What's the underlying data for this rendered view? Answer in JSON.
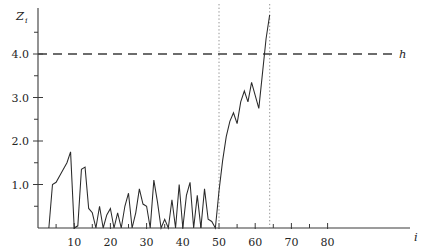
{
  "chart_data": {
    "type": "line",
    "title": "",
    "xlabel": "i",
    "ylabel": "Z_i",
    "xlim": [
      0,
      85
    ],
    "ylim": [
      0,
      4.9
    ],
    "grid": false,
    "legend_position": "inline-right",
    "x_ticks_major": [
      10,
      20,
      30,
      40,
      50,
      60,
      70,
      80
    ],
    "x_ticks_minor": [
      5,
      15,
      25,
      35,
      45,
      55,
      65,
      75
    ],
    "x_tick_labels": [
      "10",
      "20",
      "30",
      "40",
      "50",
      "60",
      "70",
      "80"
    ],
    "y_ticks_major": [
      1.0,
      2.0,
      3.0,
      4.0
    ],
    "y_ticks_minor": [
      0.5,
      1.5,
      2.5,
      3.5,
      4.5
    ],
    "y_tick_labels": [
      "1.0",
      "2.0",
      "3.0",
      "4.0"
    ],
    "annotations": [
      {
        "name": "threshold",
        "label": "h",
        "type": "hline",
        "y": 4.0,
        "style": "dashed"
      },
      {
        "name": "marker-50",
        "label": "",
        "type": "vline",
        "x": 50,
        "style": "dotted"
      },
      {
        "name": "marker-64",
        "label": "",
        "type": "vline",
        "x": 64,
        "style": "dotted"
      }
    ],
    "series": [
      {
        "name": "Z_i",
        "style": "solid",
        "x": [
          3,
          4,
          5,
          6,
          7,
          8,
          9,
          10,
          11,
          12,
          13,
          14,
          15,
          16,
          17,
          18,
          19,
          20,
          21,
          22,
          23,
          24,
          25,
          26,
          27,
          28,
          29,
          30,
          31,
          32,
          33,
          34,
          35,
          36,
          37,
          38,
          39,
          40,
          41,
          42,
          43,
          44,
          45,
          46,
          47,
          48,
          49,
          50,
          51,
          52,
          53,
          54,
          55,
          56,
          57,
          58,
          59,
          60,
          61,
          62,
          63,
          64
        ],
        "values": [
          0.0,
          1.0,
          1.05,
          1.2,
          1.35,
          1.5,
          1.75,
          0.0,
          0.05,
          1.35,
          1.4,
          0.45,
          0.35,
          0.0,
          0.5,
          0.0,
          0.3,
          0.45,
          0.0,
          0.35,
          0.0,
          0.5,
          0.8,
          0.0,
          0.35,
          0.9,
          0.55,
          0.5,
          0.0,
          1.1,
          0.6,
          0.0,
          0.2,
          0.0,
          0.65,
          0.0,
          1.0,
          0.0,
          0.75,
          1.05,
          0.0,
          0.75,
          0.0,
          0.9,
          0.2,
          0.15,
          0.0,
          0.85,
          1.55,
          2.1,
          2.45,
          2.65,
          2.4,
          2.9,
          3.15,
          2.9,
          3.35,
          3.05,
          2.75,
          3.55,
          4.35,
          4.9
        ]
      }
    ]
  },
  "labels": {
    "y_axis_main": "Z",
    "y_axis_sub": "i",
    "x_axis": "i",
    "threshold": "h"
  }
}
